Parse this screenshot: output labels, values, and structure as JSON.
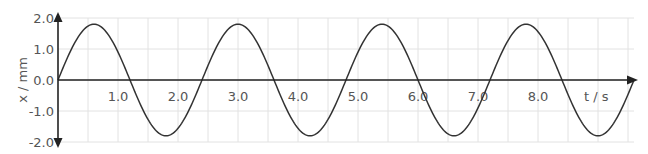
{
  "chart_data": {
    "type": "line",
    "title": "",
    "xlabel": "t / s",
    "ylabel": "x / mm",
    "xlim": [
      0,
      9.6
    ],
    "ylim": [
      -2.0,
      2.0
    ],
    "x_ticks": [
      "1.0",
      "2.0",
      "3.0",
      "4.0",
      "5.0",
      "6.0",
      "7.0",
      "8.0"
    ],
    "y_ticks": [
      "2.0",
      "1.0",
      "0.0",
      "-1.0",
      "-2.0"
    ],
    "grid": true,
    "legend": null,
    "series": [
      {
        "name": "displacement",
        "function": "x = 1.8 sin(2πt / 2.4)",
        "amplitude_mm": 1.8,
        "period_s": 2.4,
        "x": [
          0,
          0.6,
          1.2,
          1.8,
          2.4,
          3.0,
          3.6,
          4.2,
          4.8,
          5.4,
          6.0,
          6.6,
          7.2,
          7.8,
          8.4,
          9.0,
          9.6
        ],
        "values": [
          0,
          1.8,
          0,
          -1.8,
          0,
          1.8,
          0,
          -1.8,
          0,
          1.8,
          0,
          -1.8,
          0,
          1.8,
          0,
          -1.8,
          0
        ]
      }
    ]
  },
  "colors": {
    "curve": "#333333",
    "axis": "#222222",
    "grid": "#e2e2e2",
    "label": "#555555"
  }
}
